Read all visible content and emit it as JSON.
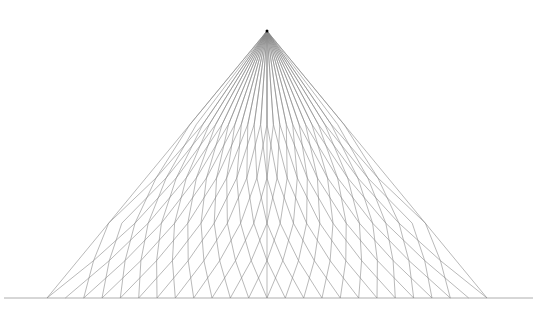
{
  "figure": {
    "apex": [
      267,
      31
    ],
    "base_line": {
      "x1": 4,
      "x2": 533,
      "y": 298
    },
    "base_left": 47,
    "base_right": 487,
    "ray_count": 25,
    "fold_levels": [
      0.0,
      0.35,
      0.55,
      0.72,
      0.86,
      1.0
    ],
    "line_color": "#8a8a8a",
    "apex_color": "#000000",
    "background": "#ffffff"
  }
}
